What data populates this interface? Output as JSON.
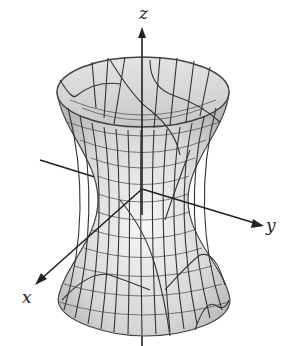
{
  "figure": {
    "axes": {
      "x_label": "x",
      "y_label": "y",
      "z_label": "z"
    },
    "colors": {
      "surface_fill_light": "#f2f2f2",
      "surface_fill_dark": "#bdbdbd",
      "mesh_line": "#3a3a3a",
      "axis_line": "#222222"
    }
  }
}
